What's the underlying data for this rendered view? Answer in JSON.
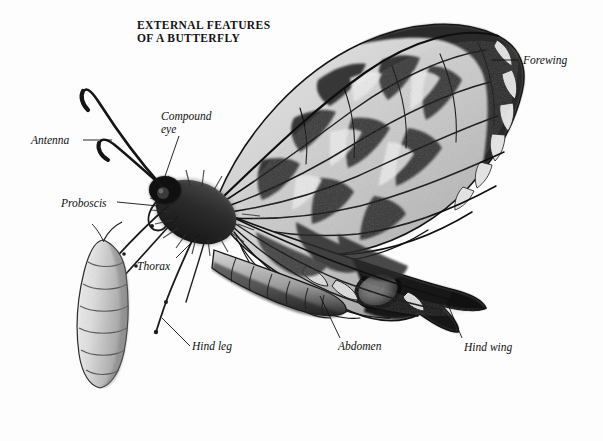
{
  "figure": {
    "title": "EXTERNAL FEATURES\nOF A BUTTERFLY",
    "medium": "black-and-white-photograph",
    "background_color": "#fdfdfd",
    "ink_color": "#101010"
  },
  "labels": {
    "antenna": "Antenna",
    "compound_eye": "Compound\neye",
    "proboscis": "Proboscis",
    "thorax": "Thorax",
    "hind_leg": "Hind leg",
    "abdomen": "Abdomen",
    "hind_wing": "Hind wing",
    "forewing": "Forewing"
  },
  "anatomy_parts": [
    "Antenna",
    "Compound eye",
    "Proboscis",
    "Thorax",
    "Hind leg",
    "Abdomen",
    "Hind wing",
    "Forewing"
  ]
}
